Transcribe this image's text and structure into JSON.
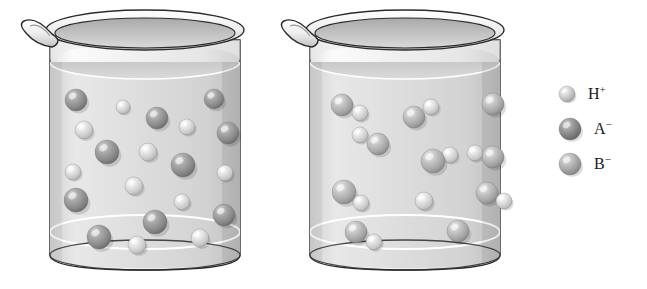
{
  "figure": {
    "type": "chemistry-illustration",
    "background_color": "#ffffff"
  },
  "beakers": [
    {
      "id": "left-beaker",
      "name": "strong-acid-beaker",
      "position": {
        "x": 22,
        "y": 12,
        "width": 222,
        "height": 262
      },
      "body": {
        "left": 50,
        "right": 240,
        "top": 30,
        "bottom": 268
      },
      "liquid_level_y": 62,
      "description": "Beaker containing fully dissociated ions: separate H+ and A- spheres",
      "contents": "dissociated",
      "particles": [
        {
          "type": "A-",
          "cx": 76,
          "cy": 100,
          "r": 11
        },
        {
          "type": "H+",
          "cx": 123,
          "cy": 107,
          "r": 7
        },
        {
          "type": "A-",
          "cx": 157,
          "cy": 118,
          "r": 11
        },
        {
          "type": "A-",
          "cx": 214,
          "cy": 99,
          "r": 10
        },
        {
          "type": "H+",
          "cx": 187,
          "cy": 127,
          "r": 8
        },
        {
          "type": "A-",
          "cx": 228,
          "cy": 133,
          "r": 11
        },
        {
          "type": "H+",
          "cx": 84,
          "cy": 130,
          "r": 9
        },
        {
          "type": "A-",
          "cx": 107,
          "cy": 152,
          "r": 12
        },
        {
          "type": "H+",
          "cx": 148,
          "cy": 152,
          "r": 9
        },
        {
          "type": "A-",
          "cx": 183,
          "cy": 165,
          "r": 12
        },
        {
          "type": "H+",
          "cx": 73,
          "cy": 172,
          "r": 8
        },
        {
          "type": "H+",
          "cx": 225,
          "cy": 173,
          "r": 8
        },
        {
          "type": "H+",
          "cx": 134,
          "cy": 186,
          "r": 9
        },
        {
          "type": "A-",
          "cx": 76,
          "cy": 200,
          "r": 12
        },
        {
          "type": "H+",
          "cx": 182,
          "cy": 202,
          "r": 8
        },
        {
          "type": "A-",
          "cx": 155,
          "cy": 222,
          "r": 12
        },
        {
          "type": "A-",
          "cx": 224,
          "cy": 215,
          "r": 11
        },
        {
          "type": "A-",
          "cx": 99,
          "cy": 237,
          "r": 12
        },
        {
          "type": "H+",
          "cx": 137,
          "cy": 245,
          "r": 9
        },
        {
          "type": "H+",
          "cx": 200,
          "cy": 238,
          "r": 9
        }
      ]
    },
    {
      "id": "right-beaker",
      "name": "weak-acid-beaker",
      "position": {
        "x": 282,
        "y": 12,
        "width": 222,
        "height": 262
      },
      "body": {
        "left": 310,
        "right": 500,
        "top": 30,
        "bottom": 268
      },
      "liquid_level_y": 62,
      "description": "Beaker containing mostly undissociated HB molecules: B- spheres paired with H+ spheres",
      "contents": "mostly-undissociated",
      "particles": [
        {
          "type": "B-",
          "cx": 342,
          "cy": 105,
          "r": 11
        },
        {
          "type": "H+",
          "cx": 360,
          "cy": 113,
          "r": 8
        },
        {
          "type": "B-",
          "cx": 414,
          "cy": 117,
          "r": 11
        },
        {
          "type": "H+",
          "cx": 431,
          "cy": 107,
          "r": 8
        },
        {
          "type": "B-",
          "cx": 493,
          "cy": 104,
          "r": 11
        },
        {
          "type": "H+",
          "cx": 360,
          "cy": 135,
          "r": 8
        },
        {
          "type": "B-",
          "cx": 378,
          "cy": 144,
          "r": 11
        },
        {
          "type": "H+",
          "cx": 450,
          "cy": 155,
          "r": 8
        },
        {
          "type": "B-",
          "cx": 433,
          "cy": 161,
          "r": 12
        },
        {
          "type": "H+",
          "cx": 475,
          "cy": 153,
          "r": 8
        },
        {
          "type": "B-",
          "cx": 493,
          "cy": 157,
          "r": 11
        },
        {
          "type": "B-",
          "cx": 344,
          "cy": 192,
          "r": 12
        },
        {
          "type": "H+",
          "cx": 361,
          "cy": 203,
          "r": 8
        },
        {
          "type": "H+",
          "cx": 424,
          "cy": 201,
          "r": 9
        },
        {
          "type": "B-",
          "cx": 487,
          "cy": 193,
          "r": 11
        },
        {
          "type": "H+",
          "cx": 504,
          "cy": 201,
          "r": 8
        },
        {
          "type": "B-",
          "cx": 356,
          "cy": 232,
          "r": 11
        },
        {
          "type": "H+",
          "cx": 374,
          "cy": 242,
          "r": 8
        },
        {
          "type": "B-",
          "cx": 458,
          "cy": 231,
          "r": 11
        }
      ]
    }
  ],
  "legend": {
    "name": "particle-legend",
    "items": [
      {
        "symbol": "H",
        "charge": "+",
        "label": "H⁺",
        "key": "H+",
        "sphere_radius": 8,
        "color": "#d8d8d8",
        "highlight": "#f2f2f2",
        "shadow": "#9c9c9c"
      },
      {
        "symbol": "A",
        "charge": "−",
        "label": "A⁻",
        "key": "A-",
        "sphere_radius": 11,
        "color": "#9a9a9a",
        "highlight": "#c8c8c8",
        "shadow": "#5e5e5e"
      },
      {
        "symbol": "B",
        "charge": "−",
        "label": "B⁻",
        "key": "B-",
        "sphere_radius": 11,
        "color": "#b9b9b9",
        "highlight": "#e2e2e2",
        "shadow": "#7d7d7d"
      }
    ]
  },
  "colors": {
    "glass_outline": "#2b2b2b",
    "glass_fill": "#f4f4f4",
    "liquid_fill": "#dedede",
    "liquid_surface": "#c9c9c9",
    "background": "#ffffff",
    "text": "#1a1a1a"
  }
}
